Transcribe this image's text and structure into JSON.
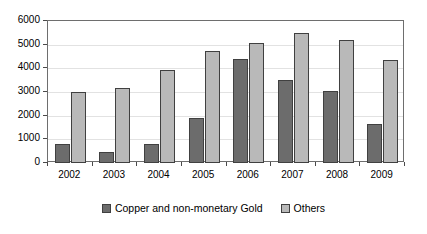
{
  "chart_data": {
    "type": "bar",
    "title": "",
    "subtitle": "",
    "xlabel": "",
    "ylabel": "",
    "categories": [
      "2002",
      "2003",
      "2004",
      "2005",
      "2006",
      "2007",
      "2008",
      "2009"
    ],
    "series": [
      {
        "name": "Copper and non-monetary Gold",
        "color": "#6c6c6c",
        "values": [
          800,
          480,
          800,
          1900,
          4400,
          3500,
          3050,
          1650
        ]
      },
      {
        "name": "Others",
        "color": "#b9b9b9",
        "values": [
          2980,
          3170,
          3930,
          4750,
          5080,
          5500,
          5180,
          4340
        ]
      }
    ],
    "ylim": [
      0,
      6000
    ],
    "y_ticks": [
      0,
      1000,
      2000,
      3000,
      4000,
      5000,
      6000
    ],
    "y_tick_labels": [
      "0",
      "1000",
      "2000",
      "3000",
      "4000",
      "5000",
      "6000"
    ],
    "grid": true,
    "grid_axis": "y",
    "legend_position": "bottom",
    "legend": [
      "Copper and non-monetary Gold",
      "Others"
    ]
  },
  "colors": {
    "series_0": "#6c6c6c",
    "series_1": "#b9b9b9",
    "bar_border": "#404040",
    "frame": "#6e6e6e",
    "gridline": "#e2e2e2",
    "background": "#ffffff",
    "text": "#000000"
  }
}
